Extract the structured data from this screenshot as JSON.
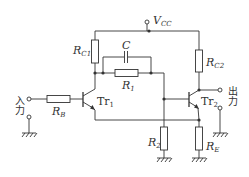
{
  "diagram": {
    "type": "circuit-schematic",
    "supply": {
      "label": "V",
      "sub": "CC"
    },
    "components": {
      "rc1": {
        "label": "R",
        "sub": "C1"
      },
      "rc2": {
        "label": "R",
        "sub": "C2"
      },
      "c": {
        "label": "C"
      },
      "r1": {
        "label": "R",
        "sub": "1"
      },
      "r2": {
        "label": "R",
        "sub": "2"
      },
      "rb": {
        "label": "R",
        "sub": "B"
      },
      "re": {
        "label": "R",
        "sub": "E"
      },
      "tr1": {
        "label": "Tr",
        "sub": "1"
      },
      "tr2": {
        "label": "Tr",
        "sub": "2"
      }
    },
    "input_label": "入力",
    "output_label": "出力",
    "colors": {
      "line": "#333333",
      "background": "#ffffff"
    }
  }
}
